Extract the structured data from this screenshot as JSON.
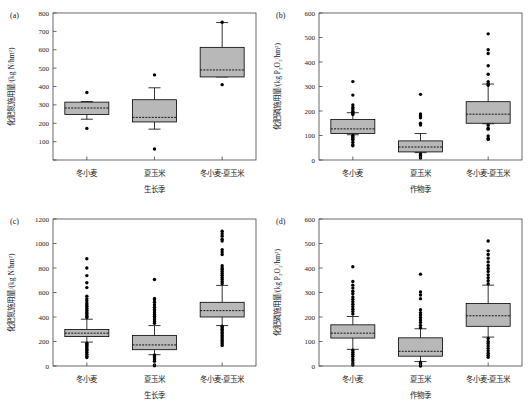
{
  "figure": {
    "title": "",
    "panel_count": 4,
    "background": "#ffffff",
    "box_fill": "#b8b8b8",
    "line_color": "#000000"
  },
  "categories_cn": [
    "冬小麦",
    "夏玉米",
    "冬小麦-夏玉米"
  ],
  "panels": [
    {
      "tag": "(a)",
      "xlabel": "生长季",
      "ylabel_main": "化肥氮施用量/(kg N/hm",
      "ylabel_sup": "2",
      "ylabel_tail": ")",
      "yticks": [
        0,
        100,
        200,
        300,
        400,
        500,
        600,
        700,
        800
      ],
      "ytick_labels": [
        "",
        "100",
        "200",
        "300",
        "400",
        "500",
        "600",
        "700",
        "800"
      ],
      "ylim": [
        0,
        800
      ]
    },
    {
      "tag": "(b)",
      "xlabel": "作物季",
      "ylabel_main": "化肥磷施用量/(kg P",
      "ylabel_sub1": "2",
      "ylabel_mid": "O",
      "ylabel_sub2": "5",
      "ylabel_tail2": "/hm",
      "ylabel_sup": "2",
      "ylabel_tail": ")",
      "yticks": [
        0,
        100,
        200,
        300,
        400,
        500,
        600
      ],
      "ytick_labels": [
        "0",
        "100",
        "200",
        "300",
        "400",
        "500",
        "600"
      ],
      "ylim": [
        0,
        600
      ]
    },
    {
      "tag": "(c)",
      "xlabel": "生长季",
      "ylabel_main": "化肥氮施用量/(kg N/hm",
      "ylabel_sup": "2",
      "ylabel_tail": ")",
      "yticks": [
        0,
        200,
        400,
        600,
        800,
        1000,
        1200
      ],
      "ytick_labels": [
        "0",
        "200",
        "400",
        "600",
        "800",
        "1000",
        "1200"
      ],
      "ylim": [
        0,
        1200
      ]
    },
    {
      "tag": "(d)",
      "xlabel": "作物季",
      "ylabel_main": "化肥磷施用量/(kg P",
      "ylabel_sub1": "2",
      "ylabel_mid": "O",
      "ylabel_sub2": "5",
      "ylabel_tail2": "/hm",
      "ylabel_sup": "2",
      "ylabel_tail": ")",
      "yticks": [
        0,
        100,
        200,
        300,
        400,
        500,
        600
      ],
      "ytick_labels": [
        "0",
        "100",
        "200",
        "300",
        "400",
        "500",
        "600"
      ],
      "ylim": [
        0,
        600
      ]
    }
  ],
  "chart_data": [
    {
      "type": "box",
      "panel": "(a)",
      "title": "",
      "xlabel": "生长季",
      "ylabel": "化肥氮施用量/(kg N/hm2)",
      "ylim": [
        0,
        800
      ],
      "yticks": [
        100,
        200,
        300,
        400,
        500,
        600,
        700,
        800
      ],
      "grid": false,
      "legend": "none",
      "categories": [
        "冬小麦",
        "夏玉米",
        "冬小麦-夏玉米"
      ],
      "boxes": [
        {
          "category": "冬小麦",
          "min": 222,
          "q1": 248,
          "median": 283,
          "q3": 315,
          "max": 318,
          "outliers": [
            367,
            172
          ]
        },
        {
          "category": "夏玉米",
          "min": 168,
          "q1": 207,
          "median": 232,
          "q3": 328,
          "max": 393,
          "outliers": [
            463,
            60
          ]
        },
        {
          "category": "冬小麦-夏玉米",
          "min": 452,
          "q1": 452,
          "median": 490,
          "q3": 613,
          "max": 748,
          "outliers": [
            750,
            410
          ]
        }
      ]
    },
    {
      "type": "box",
      "panel": "(b)",
      "title": "",
      "xlabel": "作物季",
      "ylabel": "化肥磷施用量/(kg P2O5/hm2)",
      "ylim": [
        0,
        600
      ],
      "yticks": [
        0,
        100,
        200,
        300,
        400,
        500,
        600
      ],
      "grid": false,
      "legend": "none",
      "categories": [
        "冬小麦",
        "夏玉米",
        "冬小麦-夏玉米"
      ],
      "boxes": [
        {
          "category": "冬小麦",
          "min": 103,
          "q1": 108,
          "median": 127,
          "q3": 165,
          "max": 193,
          "outliers": [
            320,
            265,
            225,
            215,
            208,
            200,
            196,
            190,
            186,
            100,
            95,
            90,
            86,
            82,
            72,
            62,
            58
          ]
        },
        {
          "category": "夏玉米",
          "min": 30,
          "q1": 33,
          "median": 53,
          "q3": 78,
          "max": 108,
          "outliers": [
            268,
            188,
            180,
            172,
            150,
            143,
            24,
            18,
            12,
            8
          ]
        },
        {
          "category": "冬小麦-夏玉米",
          "min": 148,
          "q1": 150,
          "median": 187,
          "q3": 238,
          "max": 310,
          "outliers": [
            515,
            450,
            435,
            385,
            350,
            320,
            312,
            305,
            142,
            130,
            126,
            98,
            88,
            84
          ]
        }
      ]
    },
    {
      "type": "box",
      "panel": "(c)",
      "title": "",
      "xlabel": "生长季",
      "ylabel": "化肥氮施用量/(kg N/hm2)",
      "ylim": [
        0,
        1200
      ],
      "yticks": [
        0,
        200,
        400,
        600,
        800,
        1000,
        1200
      ],
      "grid": false,
      "legend": "none",
      "categories": [
        "冬小麦",
        "夏玉米",
        "冬小麦-夏玉米"
      ],
      "boxes": [
        {
          "category": "冬小麦",
          "min": 195,
          "q1": 240,
          "median": 268,
          "q3": 298,
          "max": 382,
          "outliers": [
            875,
            800,
            738,
            680,
            640,
            570,
            548,
            532,
            515,
            500,
            488,
            472,
            455,
            440,
            428,
            416,
            404,
            396,
            186,
            176,
            168,
            158,
            148,
            136,
            126,
            112,
            96,
            80,
            70
          ]
        },
        {
          "category": "夏玉米",
          "min": 92,
          "q1": 133,
          "median": 172,
          "q3": 250,
          "max": 330,
          "outliers": [
            706,
            552,
            540,
            520,
            500,
            480,
            462,
            448,
            434,
            420,
            406,
            392,
            378,
            364,
            348,
            90,
            82,
            74,
            66,
            58,
            48,
            38,
            8,
            2
          ]
        },
        {
          "category": "冬小麦-夏玉米",
          "min": 330,
          "q1": 400,
          "median": 452,
          "q3": 520,
          "max": 658,
          "outliers": [
            1100,
            1080,
            1060,
            1035,
            1020,
            950,
            930,
            910,
            818,
            800,
            788,
            772,
            756,
            740,
            722,
            706,
            688,
            672,
            324,
            312,
            300,
            288,
            274,
            262,
            248,
            236,
            222,
            208,
            196,
            182,
            168
          ]
        }
      ]
    },
    {
      "type": "box",
      "panel": "(d)",
      "title": "",
      "xlabel": "作物季",
      "ylabel": "化肥磷施用量/(kg P2O5/hm2)",
      "ylim": [
        0,
        600
      ],
      "yticks": [
        0,
        100,
        200,
        300,
        400,
        500,
        600
      ],
      "grid": false,
      "legend": "none",
      "categories": [
        "冬小麦",
        "夏玉米",
        "冬小麦-夏玉米"
      ],
      "boxes": [
        {
          "category": "冬小麦",
          "min": 68,
          "q1": 114,
          "median": 134,
          "q3": 168,
          "max": 202,
          "outliers": [
            405,
            345,
            330,
            318,
            305,
            295,
            282,
            272,
            262,
            252,
            242,
            232,
            222,
            212,
            64,
            56,
            48,
            40,
            30,
            22,
            12,
            4
          ]
        },
        {
          "category": "夏玉米",
          "min": 18,
          "q1": 40,
          "median": 60,
          "q3": 115,
          "max": 152,
          "outliers": [
            375,
            302,
            290,
            275,
            230,
            218,
            208,
            198,
            188,
            178,
            166,
            156,
            16,
            10,
            4,
            0
          ]
        },
        {
          "category": "冬小麦-夏玉米",
          "min": 118,
          "q1": 162,
          "median": 205,
          "q3": 255,
          "max": 330,
          "outliers": [
            510,
            470,
            455,
            440,
            425,
            410,
            398,
            386,
            372,
            360,
            348,
            336,
            112,
            100,
            92,
            82,
            72,
            62,
            52,
            44,
            36
          ]
        }
      ]
    }
  ]
}
